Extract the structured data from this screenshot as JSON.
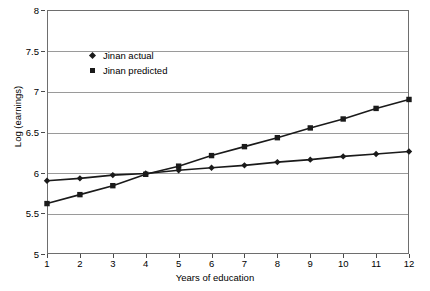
{
  "chart_data": {
    "type": "line",
    "title": "",
    "xlabel": "Years of education",
    "ylabel": "Log (earnings)",
    "x": [
      1,
      2,
      3,
      4,
      5,
      6,
      7,
      8,
      9,
      10,
      11,
      12
    ],
    "xlim": [
      1,
      12
    ],
    "ylim": [
      5,
      8
    ],
    "xticks": [
      "1",
      "2",
      "3",
      "4",
      "5",
      "6",
      "7",
      "8",
      "9",
      "10",
      "11",
      "12"
    ],
    "yticks": [
      "5",
      "5.5",
      "6",
      "6.5",
      "7",
      "7.5",
      "8"
    ],
    "grid": "horizontal",
    "legend_position": "upper-left-inside",
    "series": [
      {
        "name": "Jinan actual",
        "marker": "diamond",
        "color": "#1a1a1a",
        "values": [
          5.9,
          5.93,
          5.97,
          5.99,
          6.03,
          6.06,
          6.09,
          6.13,
          6.16,
          6.2,
          6.23,
          6.26
        ]
      },
      {
        "name": "Jinan predicted",
        "marker": "square",
        "color": "#1a1a1a",
        "values": [
          5.62,
          5.73,
          5.84,
          5.98,
          6.08,
          6.21,
          6.32,
          6.43,
          6.55,
          6.66,
          6.79,
          6.9
        ]
      }
    ]
  }
}
